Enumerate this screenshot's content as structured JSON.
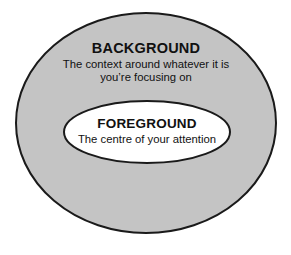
{
  "diagram": {
    "type": "concentric-ellipse-diagram",
    "canvas": {
      "width": 291,
      "height": 255,
      "background_color": "#ffffff"
    },
    "colors": {
      "outer_fill": "#c4c4c4",
      "inner_fill": "#ffffff",
      "outline": "#1a1a1a",
      "text": "#111111"
    },
    "shapes": {
      "outer_ellipse": {
        "cx": 146,
        "cy": 123,
        "rx": 130,
        "ry": 110
      },
      "inner_ellipse": {
        "cx": 147,
        "cy": 132,
        "rx": 83,
        "ry": 31
      }
    },
    "background_region": {
      "heading": "BACKGROUND",
      "caption_lines": [
        "The context around whatever it is",
        "you’re focusing on"
      ]
    },
    "foreground_region": {
      "heading": "FOREGROUND",
      "caption_lines": [
        "The centre of your attention"
      ]
    }
  }
}
